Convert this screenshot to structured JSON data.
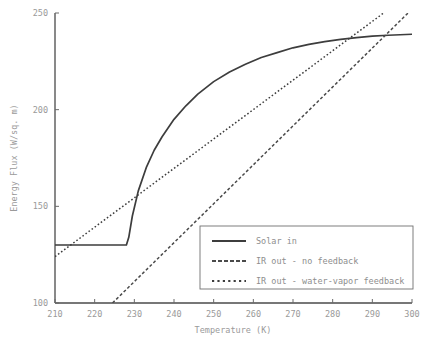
{
  "chart_data": {
    "type": "line",
    "title": "",
    "xlabel": "Temperature (K)",
    "ylabel": "Energy Flux (W/sq. m)",
    "xlim": [
      210,
      300
    ],
    "ylim": [
      100,
      250
    ],
    "xticks": [
      210,
      220,
      230,
      240,
      250,
      260,
      270,
      280,
      290,
      300
    ],
    "yticks": [
      100,
      150,
      200,
      250
    ],
    "grid": false,
    "legend_position": "lower-right-inside",
    "line_color": "#3d3d3d",
    "tick_label_color": "#9a9a9a",
    "series": [
      {
        "name": "Solar in",
        "style": "solid",
        "x": [
          210,
          215,
          220,
          224,
          226,
          227,
          228,
          228.6,
          229.5,
          231,
          233,
          235,
          237,
          240,
          243,
          246,
          250,
          254,
          258,
          262,
          266,
          270,
          274,
          278,
          282,
          286,
          290,
          294,
          300
        ],
        "values": [
          130,
          130,
          130,
          130,
          130,
          130,
          130,
          134,
          145,
          158,
          170,
          179,
          186,
          195,
          202,
          208,
          214.5,
          219.5,
          223.5,
          227,
          229.5,
          232,
          233.8,
          235.2,
          236.4,
          237.3,
          238,
          238.5,
          239
        ]
      },
      {
        "name": "IR out - no feedback",
        "style": "dashed",
        "x": [
          224.5,
          300
        ],
        "values": [
          100,
          252
        ]
      },
      {
        "name": "IR out - water-vapor feedback",
        "style": "dotted",
        "x": [
          210,
          293.5
        ],
        "values": [
          124,
          251
        ]
      }
    ]
  },
  "legend": {
    "entries": [
      {
        "label": "Solar in",
        "style": "solid"
      },
      {
        "label": "IR out - no feedback",
        "style": "dashed"
      },
      {
        "label": "IR out - water-vapor feedback",
        "style": "dotted"
      }
    ]
  },
  "axes": {
    "x_tick_labels": [
      "210",
      "220",
      "230",
      "240",
      "250",
      "260",
      "270",
      "280",
      "290",
      "300"
    ],
    "y_tick_labels": [
      "100",
      "150",
      "200",
      "250"
    ],
    "x_axis_title": "Temperature (K)",
    "y_axis_title": "Energy Flux (W/sq. m)"
  }
}
